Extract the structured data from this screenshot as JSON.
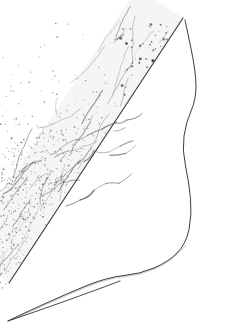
{
  "figure": {
    "technique": "stipple-and-line",
    "background_color": "#ffffff",
    "ink_color": "#2b2b2b",
    "stipple_color": "#555555",
    "ridge_color": "#6f6f6f",
    "caption": "",
    "canvas": {
      "width": 227,
      "height": 330
    },
    "regions": [
      {
        "name": "dorsal-margin",
        "label": "Dorsal margin",
        "description": "Straight dark ruled edge running from upper right to lower left"
      },
      {
        "name": "ridge-striation-field",
        "label": "Ridge striation field",
        "description": "Band of wavy broken longitudinal lines parallel to the dorsal margin"
      },
      {
        "name": "stipple-body",
        "label": "Stippled body",
        "description": "Dense graded dot shading forming the lower lobe"
      },
      {
        "name": "distal-margin",
        "label": "Distal margin",
        "description": "Sinuous right-hand contour with a concave waist and rounded apex"
      },
      {
        "name": "ventral-margin",
        "label": "Ventral margin",
        "description": "Long concave sweep forming the lower-left point"
      },
      {
        "name": "dark-speckle-cluster",
        "label": "Dark speckles",
        "description": "Scattered heavy dots in the upper right quadrant"
      }
    ]
  },
  "geometry": {
    "dorsal_line": [
      [
        183,
        18
      ],
      [
        9,
        283
      ]
    ],
    "distal_contour": [
      [
        185,
        20
      ],
      [
        196,
        72
      ],
      [
        196,
        100
      ],
      [
        186,
        122
      ],
      [
        182,
        150
      ],
      [
        189,
        182
      ],
      [
        192,
        215
      ],
      [
        186,
        244
      ],
      [
        168,
        262
      ],
      [
        140,
        274
      ],
      [
        108,
        277
      ],
      [
        66,
        294
      ],
      [
        18,
        316
      ],
      [
        8,
        321
      ]
    ],
    "waist_x": 182,
    "apex_y": 20,
    "tip": [
      8,
      321
    ]
  },
  "stipple": {
    "seed": 20240518,
    "dot_count": 5400,
    "dot_radius_min": 0.35,
    "dot_radius_max": 0.85,
    "core_center": [
      118,
      215
    ],
    "core_radius": 62
  },
  "ridges": {
    "count": 46,
    "min_length": 8,
    "max_length": 52,
    "angle_degrees": -56
  }
}
